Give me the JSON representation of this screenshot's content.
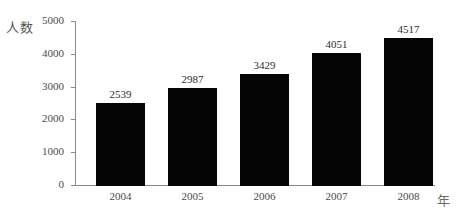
{
  "chart_data": {
    "type": "bar",
    "title": "",
    "subtitle": "",
    "categories": [
      "2004",
      "2005",
      "2006",
      "2007",
      "2008"
    ],
    "values": [
      2539,
      2987,
      3429,
      4051,
      4517
    ],
    "data_labels": [
      "2539",
      "2987",
      "3429",
      "4051",
      "4517"
    ],
    "xlabel": "年",
    "ylabel": "人数",
    "ylim": [
      0,
      5000
    ],
    "y_ticks": [
      0,
      1000,
      2000,
      3000,
      4000,
      5000
    ],
    "y_tick_labels": [
      "0",
      "1000",
      "2000",
      "3000",
      "4000",
      "5000"
    ],
    "grid": false,
    "legend": false,
    "legend_position": "none",
    "bar_color": "#050505",
    "axis_color": "#8a8a8a",
    "text_color": "#4a4a4a",
    "background": "#ffffff"
  }
}
